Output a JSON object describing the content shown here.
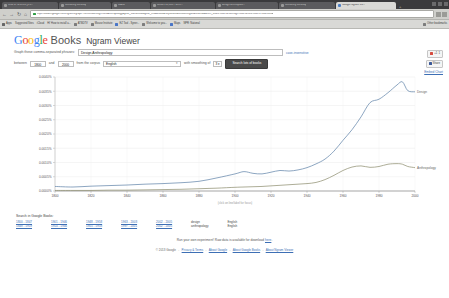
{
  "browser": {
    "tabs": [
      {
        "title": "Web of Science [v.5...",
        "active": false
      },
      {
        "title": "Mendeley Desktop",
        "active": false
      },
      {
        "title": "MAKE",
        "active": false
      },
      {
        "title": "Ulearn 11,588 - unre...",
        "active": false
      },
      {
        "title": "design anthropolo...",
        "active": false
      },
      {
        "title": "Mendeley Desktop",
        "active": false
      },
      {
        "title": "Google Ngram Vie...",
        "active": true
      }
    ],
    "new_tab_label": "+",
    "url": "https://books.google.com/ngrams/graph?content=Design%2CAnthropology&year_start=1800&year_end=2000&corpus=15&smoothing=3&share=&direct_url=t1%3B%2CDesign%3B%2Cc0%3B.t1%3B%2CA",
    "url_domain": "books.google.com",
    "bookmarks": [
      "Apps",
      "Suggested Sites",
      "iCloud",
      "Hi! How to install a...",
      "ATBDTV",
      "Mouse Institute",
      "EZ Tool - Syner...",
      "Welcome to you...",
      "Maps",
      "NPR: National"
    ],
    "other_bookmarks": "Other bookmarks"
  },
  "header": {
    "logo_letters": [
      "G",
      "o",
      "o",
      "g",
      "l",
      "e"
    ],
    "books": "Books",
    "ngram_viewer": "Ngram Viewer"
  },
  "form": {
    "query_label": "Graph these comma-separated phrases:",
    "query_value": "Design,Anthropology",
    "case_insensitive": "case-insensitive",
    "between_label": "between",
    "year_start": "1800",
    "and_label": "and",
    "year_end": "2000",
    "corpus_label": "from the corpus",
    "corpus_value": "English",
    "corpus_caret": "▾",
    "smoothing_label": "with smoothing of",
    "smoothing_value": "3",
    "smoothing_caret": "▾",
    "search_button": "Search lots of books"
  },
  "share": {
    "gplus_label": "+1",
    "gplus_count": "1",
    "share_label": "Share",
    "embed_label": "Embed Chart"
  },
  "chart_data": {
    "type": "line",
    "title": "",
    "xlabel": "(click on line/label for focus)",
    "ylabel": "",
    "xlim": [
      1800,
      2000
    ],
    "ylim": [
      0.0,
      0.004
    ],
    "xticks": [
      1800,
      1820,
      1840,
      1860,
      1880,
      1900,
      1920,
      1940,
      1960,
      1980,
      2000
    ],
    "ytick_labels": [
      "0.0000%",
      "0.0005%",
      "0.0010%",
      "0.0015%",
      "0.0020%",
      "0.0025%",
      "0.0030%",
      "0.0035%",
      "0.0040%"
    ],
    "yticks": [
      0.0,
      0.0005,
      0.001,
      0.0015,
      0.002,
      0.0025,
      0.003,
      0.0035,
      0.004
    ],
    "grid": true,
    "legend_position": "right-inline",
    "x": [
      1800,
      1810,
      1820,
      1830,
      1840,
      1850,
      1860,
      1870,
      1880,
      1890,
      1900,
      1905,
      1910,
      1915,
      1920,
      1925,
      1930,
      1935,
      1940,
      1945,
      1950,
      1955,
      1960,
      1965,
      1970,
      1975,
      1980,
      1985,
      1990,
      1993,
      1996,
      2000
    ],
    "series": [
      {
        "name": "Design",
        "color": "#5b7fa6",
        "label": "Design",
        "values": [
          0.00016,
          0.00014,
          0.00017,
          0.00019,
          0.00021,
          0.00024,
          0.00026,
          0.00029,
          0.00034,
          0.00046,
          0.0006,
          0.00068,
          0.00062,
          0.0006,
          0.00066,
          0.00072,
          0.0007,
          0.00074,
          0.00082,
          0.00095,
          0.00112,
          0.0014,
          0.00178,
          0.00215,
          0.0026,
          0.0031,
          0.00322,
          0.00345,
          0.00372,
          0.00383,
          0.00352,
          0.00348
        ]
      },
      {
        "name": "Anthropology",
        "color": "#8a8a6a",
        "label": "Anthropology",
        "values": [
          2e-05,
          2e-05,
          2e-05,
          3e-05,
          3e-05,
          4e-05,
          5e-05,
          6e-05,
          8e-05,
          0.0001,
          0.00013,
          0.00014,
          0.00015,
          0.00016,
          0.00018,
          0.0002,
          0.00022,
          0.00024,
          0.00026,
          0.0003,
          0.0004,
          0.00055,
          0.00072,
          0.00084,
          0.00088,
          0.00083,
          0.00086,
          0.00094,
          0.00096,
          0.00094,
          0.00086,
          0.00082
        ]
      }
    ]
  },
  "search_books": {
    "title": "Search in Google Books:",
    "columns": [
      {
        "links": [
          "1800 - 1847",
          "1848 - 1919"
        ],
        "word": ""
      },
      {
        "links": [
          "1901 - 1946",
          "1914 - 1946"
        ],
        "word": ""
      },
      {
        "links": [
          "1948 - 1958",
          "1955 - 1958"
        ],
        "word": ""
      },
      {
        "links": [
          "1963 - 2003",
          "1997 - 2001"
        ],
        "word": ""
      },
      {
        "links": [
          "2002 - 2005",
          "2002 - 2005"
        ],
        "word": ""
      }
    ],
    "word_col": [
      "design",
      "anthropology"
    ],
    "lang_col": [
      "English",
      "English"
    ]
  },
  "footer": {
    "note_prefix": "Run your own experiment! Raw data is available for download",
    "note_link": "here",
    "note_suffix": ".",
    "copyright": "© 2013 Google",
    "links": [
      "Privacy & Terms",
      "About Google",
      "About Google Books",
      "About Ngram Viewer"
    ]
  }
}
